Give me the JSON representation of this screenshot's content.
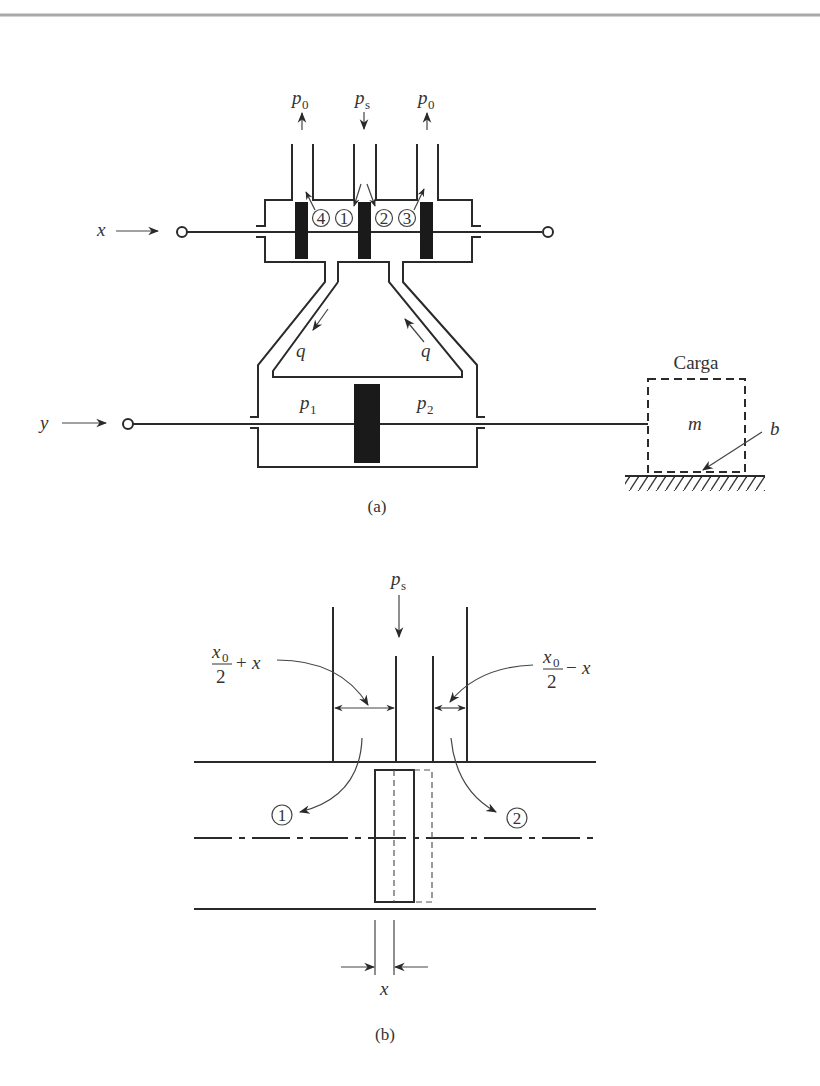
{
  "figure_a": {
    "caption": "(a)",
    "supply_pressure": {
      "symbol": "p",
      "sub": "s"
    },
    "return_pressure_left": {
      "symbol": "p",
      "sub": "0"
    },
    "return_pressure_right": {
      "symbol": "p",
      "sub": "0"
    },
    "input_label": "x",
    "output_label": "y",
    "port_numbers": [
      "4",
      "1",
      "2",
      "3"
    ],
    "flow_label_left": "q",
    "flow_label_right": "q",
    "chamber_left": {
      "symbol": "p",
      "sub": "1"
    },
    "chamber_right": {
      "symbol": "p",
      "sub": "2"
    },
    "load": {
      "title": "Carga",
      "mass_label": "m",
      "damping_label": "b"
    }
  },
  "figure_b": {
    "caption": "(b)",
    "supply_pressure": {
      "symbol": "p",
      "sub": "s"
    },
    "left_opening": {
      "num": "x",
      "num_sub": "0",
      "den": "2",
      "op": "+",
      "var": "x"
    },
    "right_opening": {
      "num": "x",
      "num_sub": "0",
      "den": "2",
      "op": "−",
      "var": "x"
    },
    "port_numbers": [
      "1",
      "2"
    ],
    "displacement_label": "x"
  },
  "colors": {
    "ink": "#2a2a2a",
    "background": "#ffffff",
    "border": "#a8a8a8"
  }
}
